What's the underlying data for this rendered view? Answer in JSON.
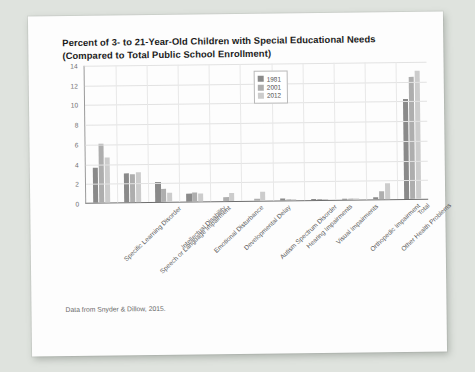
{
  "page": {
    "background_color": "#dfe3de",
    "paper_color": "#fdfdfd",
    "source_note": "Data from Snyder & Dillow, 2015."
  },
  "chart_data": {
    "type": "bar",
    "title": "Percent of 3- to 21-Year-Old Children with Special Educational Needs (Compared to Total Public School Enrollment)",
    "title_line1": "Percent of 3- to 21-Year-Old Children with Special Educational Needs",
    "title_line2": "(Compared to Total Public School Enrollment)",
    "xlabel": "",
    "ylabel": "",
    "ylim": [
      0,
      14
    ],
    "yticks": [
      0,
      2,
      4,
      6,
      8,
      10,
      12,
      14
    ],
    "grid": true,
    "legend_position": "top-center",
    "categories": [
      "Specific Learning Disorder",
      "Speech or Language Impairment",
      "Intellectual Disability",
      "Emotional Disturbance",
      "Developmental Delay",
      "Autism Spectrum Disorder",
      "Hearing Impairments",
      "Visual Impairments",
      "Orthopedic Impairment",
      "Other Health Problems",
      "Total"
    ],
    "series": [
      {
        "name": "1981",
        "color": "#8a8a8a",
        "values": [
          3.6,
          2.9,
          2.0,
          0.8,
          0.0,
          0.0,
          0.2,
          0.1,
          0.1,
          0.2,
          10.1
        ]
      },
      {
        "name": "2001",
        "color": "#aeaeae",
        "values": [
          6.0,
          2.8,
          1.3,
          0.9,
          0.4,
          0.2,
          0.15,
          0.06,
          0.15,
          0.8,
          12.4
        ]
      },
      {
        "name": "2012",
        "color": "#cccccc",
        "values": [
          4.6,
          3.0,
          0.9,
          0.8,
          0.8,
          0.9,
          0.15,
          0.06,
          0.1,
          1.6,
          13.0
        ]
      }
    ]
  }
}
